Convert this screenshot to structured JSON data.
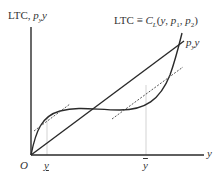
{
  "diagram": {
    "y_axis_label": "LTC, pᵧy",
    "y_axis_label_parts": {
      "main": "LTC, ",
      "p": "p",
      "sub": "y",
      "y": "y"
    },
    "x_axis_label": "y",
    "origin_label": "O",
    "cost_curve_label": "LTC ≡ C_L(y, p₁, p₂)",
    "cost_curve_label_parts": {
      "lhs": "LTC ≡ ",
      "C": "C",
      "Csub": "L",
      "args_open": "(",
      "y": "y",
      "sep1": ", ",
      "p1": "p",
      "p1sub": "1",
      "sep2": ", ",
      "p2": "p",
      "p2sub": "2",
      "args_close": ")"
    },
    "revenue_line_label_parts": {
      "p": "p",
      "sub": "y",
      "y": "y"
    },
    "tick_y_low": "y̲",
    "tick_y_high": "ȳ",
    "tick_y_low_parts": {
      "text": "y"
    },
    "tick_y_high_parts": {
      "text": "y"
    },
    "colors": {
      "line": "#2a2a2a",
      "dashed": "#555555",
      "guide": "#bbbbbb",
      "text": "#333333"
    }
  }
}
